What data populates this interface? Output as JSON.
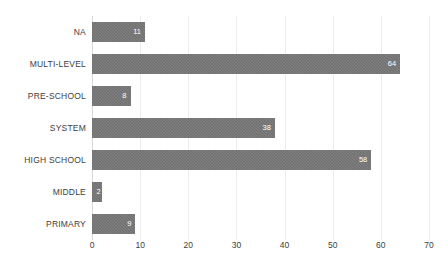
{
  "chart_data": {
    "type": "bar",
    "orientation": "horizontal",
    "title": "",
    "xlabel": "",
    "ylabel": "",
    "categories": [
      "NA",
      "MULTI-LEVEL",
      "PRE-SCHOOL",
      "SYSTEM",
      "HIGH SCHOOL",
      "MIDDLE",
      "PRIMARY"
    ],
    "values": [
      11,
      64,
      8,
      38,
      58,
      2,
      9
    ],
    "xlim": [
      0,
      70
    ],
    "xticks": [
      0,
      10,
      20,
      30,
      40,
      50,
      60,
      70
    ],
    "xtick_labels": [
      "0",
      "10",
      "20",
      "30",
      "40",
      "50",
      "60",
      "70"
    ],
    "grid": true,
    "grid_axis": "x",
    "legend": false,
    "data_labels": true,
    "bar_color": "#6e6e6e",
    "data_label_color": "#ffffff",
    "gridline_color": "#ededed",
    "axis_line_color": "#d9d9d9",
    "tick_label_color": "#404040",
    "background_color": "#ffffff"
  }
}
